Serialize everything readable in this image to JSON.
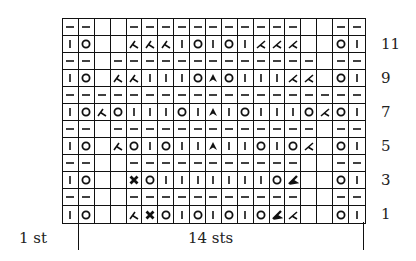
{
  "chart_data": {
    "type": "table",
    "columns": 19,
    "rows_count": 12,
    "legend_codes": {
      "p": "purl (dash)",
      "k": "knit (vertical bar)",
      "o": "yarn over (circle)",
      "r": "right-leaning decrease",
      "l": "left-leaning decrease",
      "c": "centered double decrease",
      "x": "bold twisted decrease",
      "b": "bold left-slanted decrease",
      "n": "no stitch (blank)"
    },
    "rows_top_to_bottom": [
      {
        "row": 12,
        "cells": [
          "p",
          "p",
          "n",
          "n",
          "p",
          "p",
          "p",
          "p",
          "p",
          "p",
          "p",
          "p",
          "p",
          "p",
          "p",
          "n",
          "n",
          "p",
          "p"
        ]
      },
      {
        "row": 11,
        "cells": [
          "k",
          "o",
          "n",
          "n",
          "r",
          "r",
          "r",
          "k",
          "o",
          "k",
          "o",
          "k",
          "l",
          "l",
          "l",
          "n",
          "n",
          "o",
          "k"
        ]
      },
      {
        "row": 10,
        "cells": [
          "p",
          "p",
          "n",
          "p",
          "p",
          "p",
          "p",
          "p",
          "p",
          "p",
          "p",
          "p",
          "p",
          "p",
          "p",
          "p",
          "n",
          "p",
          "p"
        ]
      },
      {
        "row": 9,
        "cells": [
          "k",
          "o",
          "n",
          "r",
          "r",
          "k",
          "k",
          "k",
          "o",
          "c",
          "o",
          "k",
          "k",
          "k",
          "l",
          "l",
          "n",
          "o",
          "k"
        ]
      },
      {
        "row": 8,
        "cells": [
          "p",
          "p",
          "p",
          "p",
          "p",
          "p",
          "p",
          "p",
          "p",
          "p",
          "p",
          "p",
          "p",
          "p",
          "p",
          "p",
          "p",
          "p",
          "p"
        ]
      },
      {
        "row": 7,
        "cells": [
          "k",
          "o",
          "r",
          "o",
          "k",
          "k",
          "k",
          "o",
          "k",
          "c",
          "k",
          "o",
          "k",
          "k",
          "k",
          "o",
          "l",
          "o",
          "k"
        ]
      },
      {
        "row": 6,
        "cells": [
          "p",
          "p",
          "n",
          "p",
          "p",
          "p",
          "p",
          "p",
          "p",
          "p",
          "p",
          "p",
          "p",
          "p",
          "p",
          "p",
          "n",
          "p",
          "p"
        ]
      },
      {
        "row": 5,
        "cells": [
          "k",
          "o",
          "n",
          "r",
          "o",
          "k",
          "o",
          "k",
          "k",
          "c",
          "k",
          "k",
          "o",
          "k",
          "o",
          "l",
          "n",
          "o",
          "k"
        ]
      },
      {
        "row": 4,
        "cells": [
          "p",
          "p",
          "n",
          "n",
          "p",
          "p",
          "p",
          "p",
          "p",
          "p",
          "p",
          "p",
          "p",
          "p",
          "p",
          "n",
          "n",
          "p",
          "p"
        ]
      },
      {
        "row": 3,
        "cells": [
          "k",
          "o",
          "n",
          "n",
          "x",
          "o",
          "k",
          "k",
          "k",
          "k",
          "k",
          "k",
          "k",
          "o",
          "b",
          "n",
          "n",
          "o",
          "k"
        ]
      },
      {
        "row": 2,
        "cells": [
          "p",
          "p",
          "n",
          "n",
          "p",
          "p",
          "p",
          "p",
          "p",
          "p",
          "p",
          "p",
          "p",
          "p",
          "p",
          "n",
          "n",
          "p",
          "p"
        ]
      },
      {
        "row": 1,
        "cells": [
          "k",
          "o",
          "n",
          "n",
          "r",
          "x",
          "o",
          "k",
          "o",
          "k",
          "o",
          "k",
          "o",
          "b",
          "l",
          "n",
          "n",
          "o",
          "k"
        ]
      }
    ],
    "row_labels": [
      {
        "label": "11",
        "row": 11
      },
      {
        "label": "9",
        "row": 9
      },
      {
        "label": "7",
        "row": 7
      },
      {
        "label": "5",
        "row": 5
      },
      {
        "label": "3",
        "row": 3
      },
      {
        "label": "1",
        "row": 1
      }
    ],
    "bottom_labels": {
      "edge": "1 st",
      "repeat": "14 sts"
    }
  }
}
